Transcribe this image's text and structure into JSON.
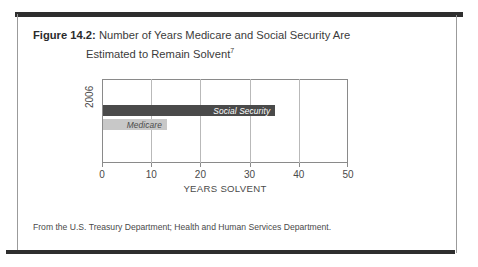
{
  "figure": {
    "number_label": "Figure 14.2:",
    "title_line1": "Number of Years Medicare and Social Security Are",
    "title_line2": "Estimated to Remain Solvent",
    "footnote_marker": "7",
    "source_note": "From the U.S. Treasury Department; Health and Human Services Department."
  },
  "chart_data": {
    "type": "bar",
    "orientation": "horizontal",
    "title": "Number of Years Medicare and Social Security Are Estimated to Remain Solvent",
    "categories": [
      "2006"
    ],
    "series": [
      {
        "name": "Social Security",
        "values": [
          35
        ],
        "color": "#4a4a4a",
        "label_color": "#ffffff"
      },
      {
        "name": "Medicare",
        "values": [
          13
        ],
        "color": "#c8c8c8",
        "label_color": "#4a4a4a"
      }
    ],
    "xlabel": "YEARS SOLVENT",
    "ylabel": "2006",
    "xlim": [
      0,
      50
    ],
    "xticks": [
      0,
      10,
      20,
      30,
      40,
      50
    ],
    "xtick_labels": [
      "0",
      "10",
      "20",
      "30",
      "40",
      "50"
    ],
    "grid": "vertical",
    "legend": "in-bar-labels",
    "frame": true
  },
  "colors": {
    "rule": "#2e2e2e",
    "frame_line": "#9b9b9b",
    "axis": "#8a8a8a",
    "gridline": "#b9b9b9",
    "text": "#4a4a4a",
    "bar_dark": "#4a4a4a",
    "bar_light": "#c8c8c8"
  }
}
